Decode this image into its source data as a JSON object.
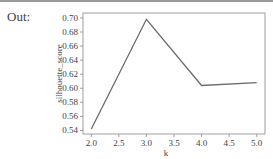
{
  "prompt": {
    "label": "Out:"
  },
  "colors": {
    "line": "#6a6a6a",
    "axes": "#888888",
    "text": "#444444"
  },
  "chart_data": {
    "type": "line",
    "title": "",
    "xlabel": "k",
    "ylabel": "silhouette_score",
    "x": [
      2,
      3,
      4,
      5
    ],
    "series": [
      {
        "name": "silhouette_score",
        "values": [
          0.542,
          0.698,
          0.604,
          0.608
        ]
      }
    ],
    "xlim": [
      1.85,
      5.15
    ],
    "ylim": [
      0.535,
      0.707
    ],
    "xticks": [
      "2.0",
      "2.5",
      "3.0",
      "3.5",
      "4.0",
      "4.5",
      "5.0"
    ],
    "yticks": [
      "0.54",
      "0.56",
      "0.58",
      "0.60",
      "0.62",
      "0.64",
      "0.66",
      "0.68",
      "0.70"
    ],
    "grid": false,
    "legend": null
  }
}
